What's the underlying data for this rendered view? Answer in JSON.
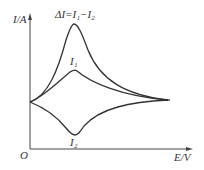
{
  "axes": {
    "y_label": "I/A",
    "x_label": "E/V",
    "origin": "O"
  },
  "curves": {
    "delta": {
      "label": "ΔI=I₁−I₂"
    },
    "i1": {
      "label": "I₁"
    },
    "i2": {
      "label": "I₂"
    }
  },
  "colors": {
    "line": "#333333",
    "background": "#ffffff"
  }
}
